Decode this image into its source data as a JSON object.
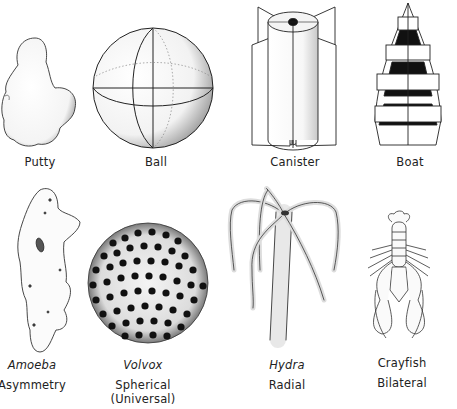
{
  "figure": {
    "top_row": [
      {
        "id": "putty",
        "label": "Putty"
      },
      {
        "id": "ball",
        "label": "Ball"
      },
      {
        "id": "canister",
        "label": "Canister"
      },
      {
        "id": "boat",
        "label": "Boat"
      }
    ],
    "bottom_row": [
      {
        "id": "amoeba",
        "organism": "Amoeba",
        "symmetry": "Asymmetry"
      },
      {
        "id": "volvox",
        "organism": "Volvox",
        "symmetry": "Spherical",
        "symmetry_note": "(Universal)"
      },
      {
        "id": "hydra",
        "organism": "Hydra",
        "symmetry": "Radial"
      },
      {
        "id": "crayfish",
        "organism": "Crayfish",
        "symmetry": "Bilateral"
      }
    ]
  }
}
